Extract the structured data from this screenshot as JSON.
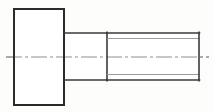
{
  "document": {
    "kind": "engineering-drawing",
    "subject": "socket head cap screw",
    "view": "side elevation",
    "canvas_width": 214,
    "canvas_height": 112,
    "background_color": "#fdfdfc"
  },
  "palette": {
    "outline": "#2b2b2b",
    "outline_secondary": "#3a3a3a",
    "thread_line": "#9b9b9b",
    "center_line": "#8f8f8f",
    "face": "#ffffff"
  },
  "geometry": {
    "head": {
      "label": "head",
      "x": 14,
      "y": 9,
      "width": 50,
      "height": 96,
      "path": "M 14 9 L 64 9 L 64 105 L 14 105 Z"
    },
    "shank": {
      "label": "plain shank",
      "x": 64,
      "y": 33,
      "width": 43,
      "height": 47,
      "top_path": "M 64 33 L 107 33",
      "bottom_path": "M 64 80 L 107 80"
    },
    "thread_start": {
      "label": "thread runout line",
      "path": "M 107 33 L 107 80"
    },
    "threaded_body": {
      "label": "threaded shaft",
      "x": 107,
      "y": 33,
      "width": 92,
      "height": 47,
      "major_top": "M 107 33 L 199 33",
      "major_bottom": "M 107 80 L 199 80",
      "minor_top": "M 107 38.5 L 199 38.5",
      "minor_bottom": "M 107 74.5 L 199 74.5"
    },
    "end_face": {
      "label": "end face",
      "path": "M 199 33 L 199 80"
    },
    "center_line": {
      "label": "axis centerline",
      "y": 57,
      "x_start": 6,
      "x_end": 209,
      "dash_pattern": "16 3 3 3"
    }
  },
  "annotations": {
    "title": "",
    "dimensions": [],
    "notes": []
  }
}
